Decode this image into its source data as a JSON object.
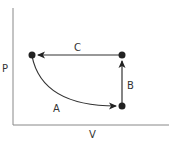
{
  "diagram": {
    "type": "PV-cycle",
    "axes": {
      "y_label": "P",
      "x_label": "V"
    },
    "points": [
      {
        "id": "top-left",
        "x": 32,
        "y": 55
      },
      {
        "id": "top-right",
        "x": 122,
        "y": 55
      },
      {
        "id": "bottom-right",
        "x": 122,
        "y": 106
      }
    ],
    "processes": [
      {
        "label": "A",
        "from": "top-left",
        "to": "bottom-right",
        "shape": "curve"
      },
      {
        "label": "B",
        "from": "bottom-right",
        "to": "top-right",
        "shape": "vertical"
      },
      {
        "label": "C",
        "from": "top-right",
        "to": "top-left",
        "shape": "horizontal"
      }
    ],
    "colors": {
      "line": "#333333",
      "axis": "#888888",
      "point": "#222222"
    }
  }
}
